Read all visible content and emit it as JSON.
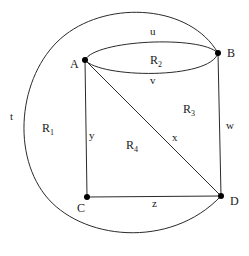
{
  "diagram": {
    "type": "planar-graph",
    "vertices": [
      {
        "id": "A",
        "label": "A"
      },
      {
        "id": "B",
        "label": "B"
      },
      {
        "id": "C",
        "label": "C"
      },
      {
        "id": "D",
        "label": "D"
      }
    ],
    "edges": [
      {
        "id": "u",
        "label": "u",
        "from": "A",
        "to": "B",
        "shape": "upper-ellipse-arc"
      },
      {
        "id": "v",
        "label": "v",
        "from": "A",
        "to": "B",
        "shape": "lower-ellipse-arc"
      },
      {
        "id": "w",
        "label": "w",
        "from": "B",
        "to": "D",
        "shape": "line"
      },
      {
        "id": "x",
        "label": "x",
        "from": "A",
        "to": "D",
        "shape": "line"
      },
      {
        "id": "y",
        "label": "y",
        "from": "A",
        "to": "C",
        "shape": "line"
      },
      {
        "id": "z",
        "label": "z",
        "from": "C",
        "to": "D",
        "shape": "line"
      },
      {
        "id": "t",
        "label": "t",
        "from": "B",
        "to": "D",
        "shape": "outer-arc"
      }
    ],
    "regions": [
      {
        "id": "R1",
        "base": "R",
        "sub": "1"
      },
      {
        "id": "R2",
        "base": "R",
        "sub": "2"
      },
      {
        "id": "R3",
        "base": "R",
        "sub": "3"
      },
      {
        "id": "R4",
        "base": "R",
        "sub": "4"
      }
    ],
    "line_color": "#2a2a2a",
    "vertex_color": "#000000"
  }
}
